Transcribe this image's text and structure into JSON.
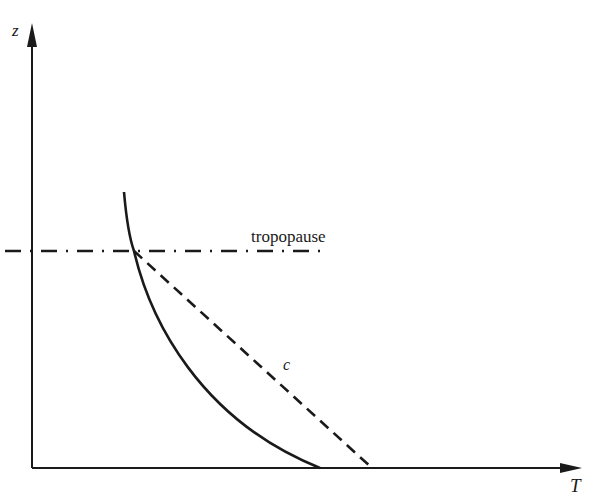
{
  "figure": {
    "axes": {
      "y_label": "z",
      "x_label": "T"
    },
    "annotations": {
      "tropopause": "tropopause",
      "dashed_curve": "c"
    },
    "colors": {
      "ink": "#1a1a1a",
      "background": "#ffffff"
    }
  }
}
